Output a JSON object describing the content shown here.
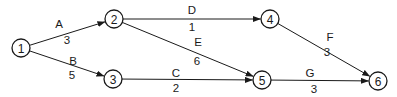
{
  "diagram": {
    "type": "activity-on-arrow network",
    "nodes": [
      {
        "id": "1",
        "label": "1",
        "x": 21,
        "y": 48
      },
      {
        "id": "2",
        "label": "2",
        "x": 114,
        "y": 19
      },
      {
        "id": "3",
        "label": "3",
        "x": 113,
        "y": 79
      },
      {
        "id": "4",
        "label": "4",
        "x": 270,
        "y": 19
      },
      {
        "id": "5",
        "label": "5",
        "x": 262,
        "y": 80
      },
      {
        "id": "6",
        "label": "6",
        "x": 378,
        "y": 81
      }
    ],
    "edges": [
      {
        "from": "1",
        "to": "2",
        "activity": "A",
        "duration": "3",
        "lx": 59,
        "ly": 24,
        "dx": 67,
        "dy": 40
      },
      {
        "from": "1",
        "to": "3",
        "activity": "B",
        "duration": "5",
        "lx": 73,
        "ly": 61,
        "dx": 72,
        "dy": 75
      },
      {
        "from": "2",
        "to": "4",
        "activity": "D",
        "duration": "1",
        "lx": 192,
        "ly": 10,
        "dx": 192,
        "dy": 27
      },
      {
        "from": "2",
        "to": "5",
        "activity": "E",
        "duration": "6",
        "lx": 198,
        "ly": 42,
        "dx": 197,
        "dy": 61
      },
      {
        "from": "3",
        "to": "5",
        "activity": "C",
        "duration": "2",
        "lx": 176,
        "ly": 73,
        "dx": 176,
        "dy": 88
      },
      {
        "from": "4",
        "to": "6",
        "activity": "F",
        "duration": "3",
        "lx": 330,
        "ly": 37,
        "dx": 327,
        "dy": 52
      },
      {
        "from": "5",
        "to": "6",
        "activity": "G",
        "duration": "3",
        "lx": 310,
        "ly": 73,
        "dx": 314,
        "dy": 89
      }
    ],
    "colors": {
      "stroke": "#1a1a1a",
      "background": "#ffffff"
    }
  }
}
